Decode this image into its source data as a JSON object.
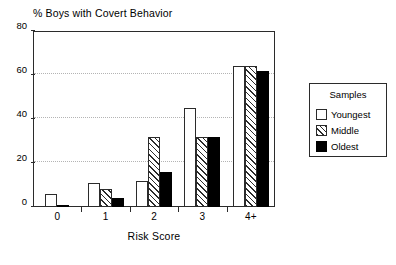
{
  "chart_data": {
    "type": "bar",
    "title": "% Boys with Covert Behavior",
    "xlabel": "Risk Score",
    "ylabel": "",
    "categories": [
      "0",
      "1",
      "2",
      "3",
      "4+"
    ],
    "series": [
      {
        "name": "Youngest",
        "values": [
          6,
          11,
          12,
          45,
          64
        ],
        "fill": "white",
        "color": "#ffffff"
      },
      {
        "name": "Middle",
        "values": [
          0,
          8,
          32,
          32,
          64
        ],
        "fill": "diagonal-hatch",
        "color": "#ffffff"
      },
      {
        "name": "Oldest",
        "values": [
          1,
          4,
          16,
          32,
          62
        ],
        "fill": "solid-black",
        "color": "#000000"
      }
    ],
    "ylim": [
      0,
      80
    ],
    "yticks": [
      "0",
      "20",
      "40",
      "60",
      "80"
    ],
    "ytick_values": [
      0,
      20,
      40,
      60,
      80
    ],
    "gridlines": {
      "enabled": true,
      "axis": "y",
      "at": [
        20,
        40,
        60
      ],
      "style": "dotted"
    },
    "legend": {
      "position": "right-outside",
      "title": "Samples",
      "entries": [
        "Youngest",
        "Middle",
        "Oldest"
      ]
    },
    "axis_color": "#2b2b2b",
    "grid_color": "#b4b4b4",
    "background": "#ffffff"
  },
  "legend": {
    "title": "Samples",
    "items": [
      {
        "label": "Youngest"
      },
      {
        "label": "Middle"
      },
      {
        "label": "Oldest"
      }
    ]
  }
}
